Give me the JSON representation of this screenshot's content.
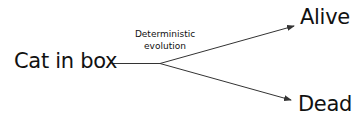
{
  "diagram": {
    "type": "branching-flow",
    "source": {
      "label": "Cat in box"
    },
    "edge_label": {
      "line1": "Deterministic",
      "line2": "evolution"
    },
    "outcomes": [
      {
        "label": "Alive"
      },
      {
        "label": "Dead"
      }
    ],
    "colors": {
      "text": "#111111",
      "line": "#333333",
      "background": "#ffffff"
    }
  }
}
